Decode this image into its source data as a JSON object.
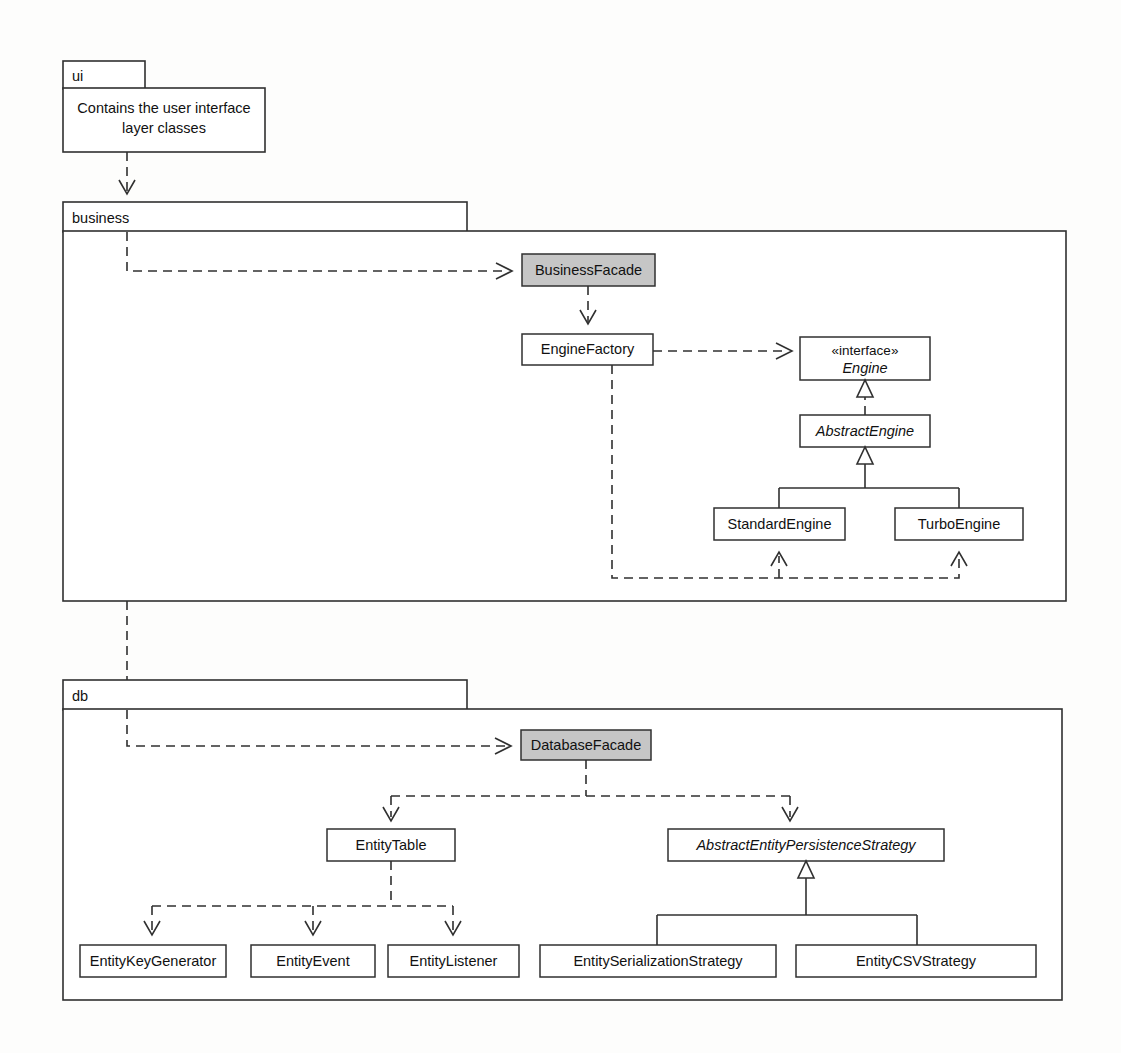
{
  "diagram": {
    "colors": {
      "line": "#303030",
      "box_fill": "#ffffff",
      "facade_fill": "#c6c6c6",
      "background": "#fdfdfc"
    },
    "packages": [
      {
        "id": "ui",
        "name": "ui",
        "note": {
          "line1": "Contains the user interface",
          "line2": "layer classes"
        }
      },
      {
        "id": "business",
        "name": "business"
      },
      {
        "id": "db",
        "name": "db"
      }
    ],
    "classes": [
      {
        "id": "businessFacade",
        "name": "BusinessFacade",
        "stereotype": "",
        "italic": false,
        "shaded": true,
        "package": "business"
      },
      {
        "id": "engineFactory",
        "name": "EngineFactory",
        "stereotype": "",
        "italic": false,
        "shaded": false,
        "package": "business"
      },
      {
        "id": "engine",
        "name": "Engine",
        "stereotype": "«interface»",
        "italic": true,
        "shaded": false,
        "package": "business"
      },
      {
        "id": "abstractEngine",
        "name": "AbstractEngine",
        "stereotype": "",
        "italic": true,
        "shaded": false,
        "package": "business"
      },
      {
        "id": "standardEngine",
        "name": "StandardEngine",
        "stereotype": "",
        "italic": false,
        "shaded": false,
        "package": "business"
      },
      {
        "id": "turboEngine",
        "name": "TurboEngine",
        "stereotype": "",
        "italic": false,
        "shaded": false,
        "package": "business"
      },
      {
        "id": "databaseFacade",
        "name": "DatabaseFacade",
        "stereotype": "",
        "italic": false,
        "shaded": true,
        "package": "db"
      },
      {
        "id": "entityTable",
        "name": "EntityTable",
        "stereotype": "",
        "italic": false,
        "shaded": false,
        "package": "db"
      },
      {
        "id": "abstractEntityPersistenceStrategy",
        "name": "AbstractEntityPersistenceStrategy",
        "stereotype": "",
        "italic": true,
        "shaded": false,
        "package": "db"
      },
      {
        "id": "entityKeyGenerator",
        "name": "EntityKeyGenerator",
        "stereotype": "",
        "italic": false,
        "shaded": false,
        "package": "db"
      },
      {
        "id": "entityEvent",
        "name": "EntityEvent",
        "stereotype": "",
        "italic": false,
        "shaded": false,
        "package": "db"
      },
      {
        "id": "entityListener",
        "name": "EntityListener",
        "stereotype": "",
        "italic": false,
        "shaded": false,
        "package": "db"
      },
      {
        "id": "entitySerializationStrategy",
        "name": "EntitySerializationStrategy",
        "stereotype": "",
        "italic": false,
        "shaded": false,
        "package": "db"
      },
      {
        "id": "entityCSVStrategy",
        "name": "EntityCSVStrategy",
        "stereotype": "",
        "italic": false,
        "shaded": false,
        "package": "db"
      }
    ],
    "relationships": [
      {
        "from": "ui",
        "to": "business",
        "kind": "dependency"
      },
      {
        "from": "business",
        "to": "businessFacade",
        "kind": "dependency"
      },
      {
        "from": "businessFacade",
        "to": "engineFactory",
        "kind": "dependency"
      },
      {
        "from": "engineFactory",
        "to": "engine",
        "kind": "dependency"
      },
      {
        "from": "abstractEngine",
        "to": "engine",
        "kind": "realization"
      },
      {
        "from": "standardEngine",
        "to": "abstractEngine",
        "kind": "generalization"
      },
      {
        "from": "turboEngine",
        "to": "abstractEngine",
        "kind": "generalization"
      },
      {
        "from": "engineFactory",
        "to": "standardEngine",
        "kind": "dependency"
      },
      {
        "from": "engineFactory",
        "to": "turboEngine",
        "kind": "dependency"
      },
      {
        "from": "business",
        "to": "db",
        "kind": "dependency"
      },
      {
        "from": "db",
        "to": "databaseFacade",
        "kind": "dependency"
      },
      {
        "from": "databaseFacade",
        "to": "entityTable",
        "kind": "dependency"
      },
      {
        "from": "databaseFacade",
        "to": "abstractEntityPersistenceStrategy",
        "kind": "dependency"
      },
      {
        "from": "entityTable",
        "to": "entityKeyGenerator",
        "kind": "dependency"
      },
      {
        "from": "entityTable",
        "to": "entityEvent",
        "kind": "dependency"
      },
      {
        "from": "entityTable",
        "to": "entityListener",
        "kind": "dependency"
      },
      {
        "from": "entitySerializationStrategy",
        "to": "abstractEntityPersistenceStrategy",
        "kind": "generalization"
      },
      {
        "from": "entityCSVStrategy",
        "to": "abstractEntityPersistenceStrategy",
        "kind": "generalization"
      }
    ]
  }
}
